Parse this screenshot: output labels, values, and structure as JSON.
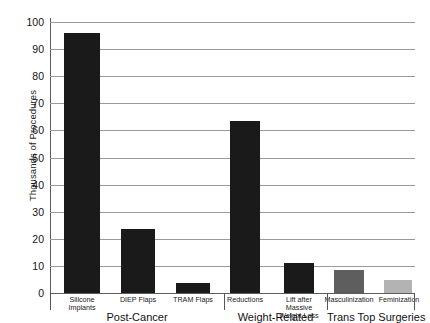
{
  "chart_data": {
    "type": "bar",
    "title": "",
    "xlabel": "",
    "ylabel": "Thousands of Procedures",
    "ylim": [
      0,
      100
    ],
    "yticks": [
      0,
      10,
      20,
      30,
      40,
      50,
      60,
      70,
      80,
      90,
      100
    ],
    "grid": true,
    "legend": "none",
    "categories": [
      "Silicone Implants",
      "DIEP Flaps",
      "TRAM Flaps",
      "Reductions",
      "Lift after Massive Weight Loss",
      "Masculinization",
      "Feminization"
    ],
    "values": [
      96,
      23.5,
      3.5,
      63.5,
      11,
      8.5,
      4.5
    ],
    "bar_colors": [
      "#1a1a1a",
      "#1a1a1a",
      "#1a1a1a",
      "#1a1a1a",
      "#1a1a1a",
      "#5e5e5e",
      "#b3b3b3"
    ],
    "groups": [
      {
        "label": "Post-Cancer",
        "members": [
          "Silicone Implants",
          "DIEP Flaps",
          "TRAM Flaps"
        ]
      },
      {
        "label": "Weight-Related",
        "members": [
          "Reductions",
          "Lift after Massive Weight Loss"
        ]
      },
      {
        "label": "Trans Top Surgeries",
        "members": [
          "Masculinization",
          "Feminization"
        ]
      }
    ]
  },
  "axis": {
    "y_title": "Thousands of Procedures",
    "tick_100": "100",
    "tick_90": "90",
    "tick_80": "80",
    "tick_70": "70",
    "tick_60": "60",
    "tick_50": "50",
    "tick_40": "40",
    "tick_30": "30",
    "tick_20": "20",
    "tick_10": "10",
    "tick_0": "0"
  },
  "bars": {
    "b0_line1": "Silicone",
    "b0_line2": "Implants",
    "b1_line1": "DIEP Flaps",
    "b2_line1": "TRAM Flaps",
    "b3_line1": "Reductions",
    "b4_line1": "Lift after",
    "b4_line2": "Massive",
    "b4_line3": "Weight Loss",
    "b5_line1": "Masculinization",
    "b6_line1": "Feminization"
  },
  "groups": {
    "g0_title": "Post-Cancer",
    "g1_title": "Weight-Related",
    "g2_title": "Trans Top Surgeries"
  },
  "colors": {
    "bar_dark": "#1a1a1a",
    "bar_mid_gray": "#5e5e5e",
    "bar_light_gray": "#b3b3b3",
    "gridline": "#9a9a9a",
    "axis": "#555555",
    "background": "#ffffff"
  }
}
